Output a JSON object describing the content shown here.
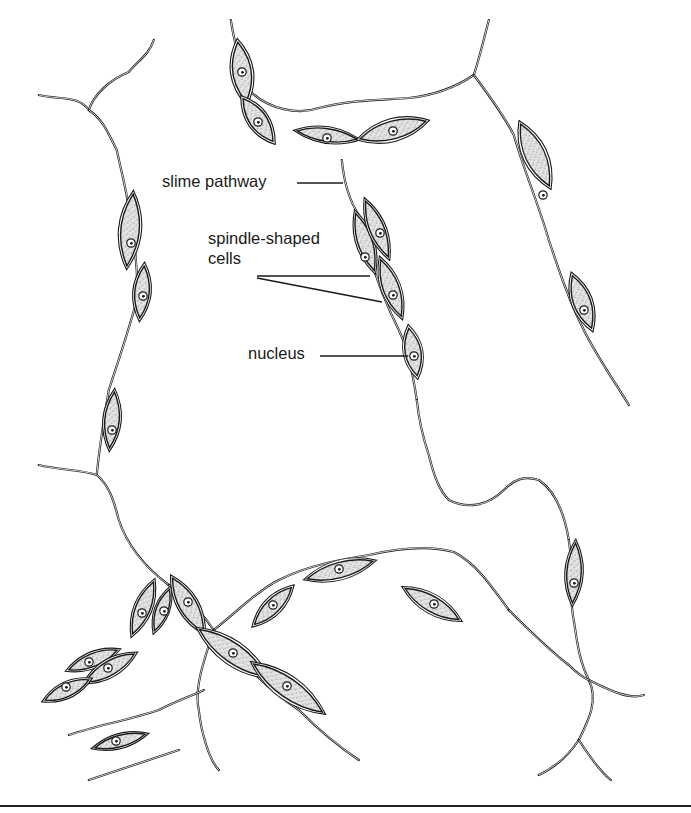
{
  "figure": {
    "type": "biological-illustration",
    "colors": {
      "ink": "#1a1a1a",
      "background": "#ffffff",
      "stipple": "#9a9a9a"
    }
  },
  "labels": [
    {
      "id": "slime-pathway",
      "text": "slime pathway",
      "x": 162,
      "y": 171,
      "leader": [
        [
          297,
          183
        ],
        [
          343,
          183
        ]
      ]
    },
    {
      "id": "spindle-shaped-cells",
      "text": "spindle-shaped",
      "text2": "cells",
      "x": 208,
      "y": 228,
      "leaders": [
        [
          [
            257,
            276
          ],
          [
            370,
            276
          ]
        ],
        [
          [
            257,
            278
          ],
          [
            382,
            302
          ]
        ]
      ]
    },
    {
      "id": "nucleus",
      "text": "nucleus",
      "x": 248,
      "y": 343,
      "leader": [
        [
          320,
          356
        ],
        [
          408,
          356
        ]
      ]
    }
  ],
  "pathways": [
    "M40,95 C60,100 80,95 90,110 C95,95 110,80 130,72 C140,60 150,55 155,40",
    "M90,110 C105,120 110,135 118,150 C122,170 128,190 130,210",
    "M130,210 C135,240 140,270 138,300 C130,330 120,360 110,390 C105,420 100,450 98,475",
    "M40,465 C60,470 85,470 98,475 C110,485 115,500 120,520 C130,550 150,570 170,585",
    "M170,585 C190,600 205,615 215,630 C240,660 270,690 300,710 C320,730 345,750 360,760",
    "M232,20 C235,40 240,60 250,90 C270,110 300,115 320,108 C350,100 380,100 410,98 C440,95 460,85 475,75",
    "M475,75 C480,60 485,40 490,20",
    "M475,75 C490,95 505,115 515,135 C525,170 540,205 550,240 C560,270 570,300 585,330 C600,360 615,380 630,405",
    "M343,160 C345,180 350,200 360,215 C370,260 385,300 400,330 C410,350 415,380 418,400",
    "M418,400 C420,420 425,440 430,455 C435,475 440,490 450,500 C470,510 490,505 505,490 C515,480 525,475 540,480 C555,490 565,510 570,540",
    "M570,540 C575,570 570,600 575,620 C578,640 580,660 590,680 C600,700 590,720 580,740",
    "M590,680 C610,690 630,700 645,695",
    "M580,740 C570,755 555,768 540,775",
    "M580,740 C590,755 600,770 612,780",
    "M215,630 C240,610 260,590 280,580 C310,565 340,560 370,555 C400,548 430,545 455,552 C480,565 495,590 510,610",
    "M510,610 C530,630 550,650 570,665 C580,675 585,678 590,680",
    "M215,630 C205,660 195,690 200,710 C202,730 210,760 220,770",
    "M70,735 C100,725 130,720 160,710 C180,700 195,695 205,690",
    "M90,780 C120,770 150,760 180,750"
  ],
  "cells": [
    {
      "cx": 242,
      "cy": 72,
      "rx": 14,
      "ry": 34,
      "rot": -8,
      "nx": 242,
      "ny": 72
    },
    {
      "cx": 258,
      "cy": 120,
      "rx": 13,
      "ry": 30,
      "rot": -35,
      "nx": 258,
      "ny": 122
    },
    {
      "cx": 327,
      "cy": 135,
      "rx": 34,
      "ry": 10,
      "rot": 8,
      "nx": 327,
      "ny": 138
    },
    {
      "cx": 393,
      "cy": 130,
      "rx": 38,
      "ry": 14,
      "rot": -15,
      "nx": 393,
      "ny": 131
    },
    {
      "cx": 130,
      "cy": 230,
      "rx": 14,
      "ry": 40,
      "rot": 5,
      "nx": 131,
      "ny": 243
    },
    {
      "cx": 142,
      "cy": 292,
      "rx": 11,
      "ry": 30,
      "rot": 5,
      "nx": 143,
      "ny": 296
    },
    {
      "cx": 112,
      "cy": 420,
      "rx": 11,
      "ry": 32,
      "rot": 5,
      "nx": 112,
      "ny": 430
    },
    {
      "cx": 365,
      "cy": 242,
      "rx": 11,
      "ry": 34,
      "rot": -18,
      "nx": 365,
      "ny": 257
    },
    {
      "cx": 377,
      "cy": 229,
      "rx": 11,
      "ry": 34,
      "rot": -22,
      "nx": 380,
      "ny": 233
    },
    {
      "cx": 391,
      "cy": 288,
      "rx": 12,
      "ry": 34,
      "rot": -20,
      "nx": 393,
      "ny": 295
    },
    {
      "cx": 413,
      "cy": 352,
      "rx": 12,
      "ry": 28,
      "rot": -10,
      "nx": 414,
      "ny": 356
    },
    {
      "cx": 535,
      "cy": 155,
      "rx": 15,
      "ry": 38,
      "rot": -25,
      "nx": 543,
      "ny": 195
    },
    {
      "cx": 582,
      "cy": 302,
      "rx": 13,
      "ry": 32,
      "rot": -20,
      "nx": 584,
      "ny": 310
    },
    {
      "cx": 574,
      "cy": 573,
      "rx": 11,
      "ry": 34,
      "rot": 3,
      "nx": 574,
      "ny": 583
    },
    {
      "cx": 432,
      "cy": 604,
      "rx": 35,
      "ry": 12,
      "rot": 30,
      "nx": 434,
      "ny": 604
    },
    {
      "cx": 340,
      "cy": 570,
      "rx": 38,
      "ry": 12,
      "rot": -15,
      "nx": 339,
      "ny": 569
    },
    {
      "cx": 273,
      "cy": 606,
      "rx": 30,
      "ry": 11,
      "rot": -45,
      "nx": 273,
      "ny": 605
    },
    {
      "cx": 143,
      "cy": 608,
      "rx": 11,
      "ry": 32,
      "rot": 22,
      "nx": 142,
      "ny": 613
    },
    {
      "cx": 162,
      "cy": 610,
      "rx": 9,
      "ry": 26,
      "rot": 20,
      "nx": 164,
      "ny": 611
    },
    {
      "cx": 188,
      "cy": 605,
      "rx": 13,
      "ry": 35,
      "rot": -30,
      "nx": 188,
      "ny": 602
    },
    {
      "cx": 233,
      "cy": 653,
      "rx": 45,
      "ry": 15,
      "rot": 35,
      "nx": 233,
      "ny": 653
    },
    {
      "cx": 288,
      "cy": 688,
      "rx": 46,
      "ry": 15,
      "rot": 35,
      "nx": 287,
      "ny": 686
    },
    {
      "cx": 93,
      "cy": 660,
      "rx": 30,
      "ry": 10,
      "rot": -22,
      "nx": 89,
      "ny": 662
    },
    {
      "cx": 110,
      "cy": 668,
      "rx": 32,
      "ry": 11,
      "rot": -30,
      "nx": 108,
      "ny": 668
    },
    {
      "cx": 67,
      "cy": 690,
      "rx": 28,
      "ry": 10,
      "rot": -25,
      "nx": 66,
      "ny": 687
    },
    {
      "cx": 120,
      "cy": 741,
      "rx": 30,
      "ry": 9,
      "rot": -15,
      "nx": 116,
      "ny": 741
    }
  ]
}
